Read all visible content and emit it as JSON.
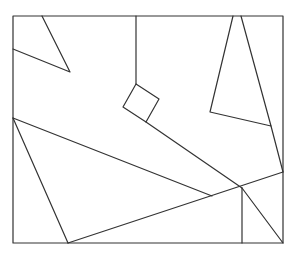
{
  "diagram": {
    "width": 299,
    "height": 258,
    "stroke": "#333333",
    "stroke_width": 1.2,
    "background": "#ffffff",
    "frame": {
      "x": 13,
      "y": 16,
      "w": 270,
      "h": 227
    },
    "shapes": [
      {
        "name": "top-left-triangle",
        "points": [
          [
            42,
            16
          ],
          [
            70,
            72
          ],
          [
            13,
            49
          ]
        ],
        "closed": false
      },
      {
        "name": "top-right-triangle",
        "points": [
          [
            233,
            16
          ],
          [
            210,
            112
          ],
          [
            271,
            126
          ],
          [
            241,
            16
          ]
        ],
        "closed": false
      },
      {
        "name": "small-square",
        "points": [
          [
            136,
            84
          ],
          [
            159,
            99
          ],
          [
            146,
            122
          ],
          [
            123,
            107
          ]
        ],
        "closed": true
      }
    ],
    "lines": [
      {
        "name": "vertical-to-square",
        "from": [
          136,
          16
        ],
        "to": [
          136,
          84
        ]
      },
      {
        "name": "square-to-junction",
        "from": [
          146,
          122
        ],
        "to": [
          242,
          188
        ]
      },
      {
        "name": "left-point-to-mid",
        "from": [
          13,
          118
        ],
        "to": [
          212,
          196
        ]
      },
      {
        "name": "left-point-to-bottom",
        "from": [
          13,
          118
        ],
        "to": [
          68,
          243
        ]
      },
      {
        "name": "bottom-to-right-edge",
        "from": [
          68,
          243
        ],
        "to": [
          283,
          172
        ]
      },
      {
        "name": "triangle-to-right-edge",
        "from": [
          271,
          126
        ],
        "to": [
          283,
          172
        ]
      },
      {
        "name": "junction-vertical",
        "from": [
          242,
          188
        ],
        "to": [
          242,
          243
        ]
      },
      {
        "name": "junction-to-corner",
        "from": [
          242,
          188
        ],
        "to": [
          283,
          243
        ]
      }
    ]
  }
}
